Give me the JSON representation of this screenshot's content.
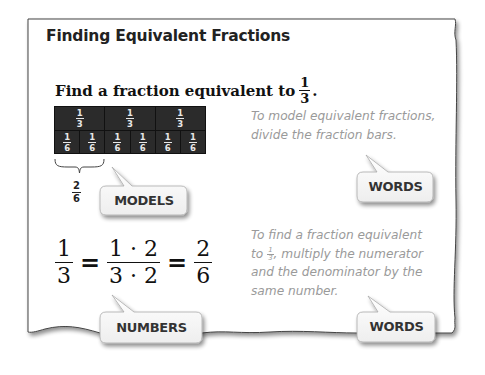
{
  "title": "Finding Equivalent Fractions",
  "prompt": {
    "text": "Find a fraction equivalent to",
    "fraction": {
      "numerator": "1",
      "denominator": "3"
    },
    "suffix": "."
  },
  "fraction_bar": {
    "top_row": [
      {
        "numerator": "1",
        "denominator": "3"
      },
      {
        "numerator": "1",
        "denominator": "3"
      },
      {
        "numerator": "1",
        "denominator": "3"
      }
    ],
    "bottom_row": [
      {
        "numerator": "1",
        "denominator": "6"
      },
      {
        "numerator": "1",
        "denominator": "6"
      },
      {
        "numerator": "1",
        "denominator": "6"
      },
      {
        "numerator": "1",
        "denominator": "6"
      },
      {
        "numerator": "1",
        "denominator": "6"
      },
      {
        "numerator": "1",
        "denominator": "6"
      }
    ],
    "brace_label": {
      "numerator": "2",
      "denominator": "6"
    },
    "colors": {
      "bar": "#2b2b2b",
      "text": "#e8e8e8"
    }
  },
  "words_top": {
    "line1": "To model equivalent fractions,",
    "line2": "divide the fraction bars."
  },
  "words_bottom": {
    "line1": "To find a fraction equivalent",
    "line2_pre": "to",
    "inline_fraction": {
      "numerator": "1",
      "denominator": "3"
    },
    "line2_post": ", multiply the numerator",
    "line3": "and the denominator by the",
    "line4": "same number."
  },
  "equation": {
    "f1": {
      "numerator": "1",
      "denominator": "3"
    },
    "eq1": "=",
    "f2": {
      "numerator": "1 · 2",
      "denominator": "3 · 2"
    },
    "eq2": "=",
    "f3": {
      "numerator": "2",
      "denominator": "6"
    }
  },
  "callouts": {
    "models": "MODELS",
    "words_top": "WORDS",
    "numbers": "NUMBERS",
    "words_bottom": "WORDS"
  }
}
